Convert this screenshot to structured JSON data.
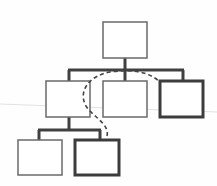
{
  "diagram": {
    "type": "tree",
    "colors": {
      "background": "#fefefe",
      "thin_stroke": "#6a6a6a",
      "thick_stroke": "#3c3c3c",
      "connector": "#404040",
      "dashed": "#444444",
      "faint_line": "#dde3e6"
    },
    "nodes": [
      {
        "id": "root",
        "level": 0,
        "highlighted": false
      },
      {
        "id": "child-left",
        "level": 1,
        "highlighted": false
      },
      {
        "id": "child-middle",
        "level": 1,
        "highlighted": false
      },
      {
        "id": "child-right",
        "level": 1,
        "highlighted": true
      },
      {
        "id": "grandchild-left",
        "level": 2,
        "highlighted": false
      },
      {
        "id": "grandchild-right",
        "level": 2,
        "highlighted": true
      }
    ],
    "edges": [
      {
        "from": "root",
        "to": "child-left"
      },
      {
        "from": "root",
        "to": "child-middle"
      },
      {
        "from": "root",
        "to": "child-right"
      },
      {
        "from": "child-left",
        "to": "grandchild-left"
      },
      {
        "from": "child-left",
        "to": "grandchild-right"
      }
    ],
    "dashed_path": {
      "from": "grandchild-right",
      "to": "child-right",
      "style": "dashed"
    }
  }
}
